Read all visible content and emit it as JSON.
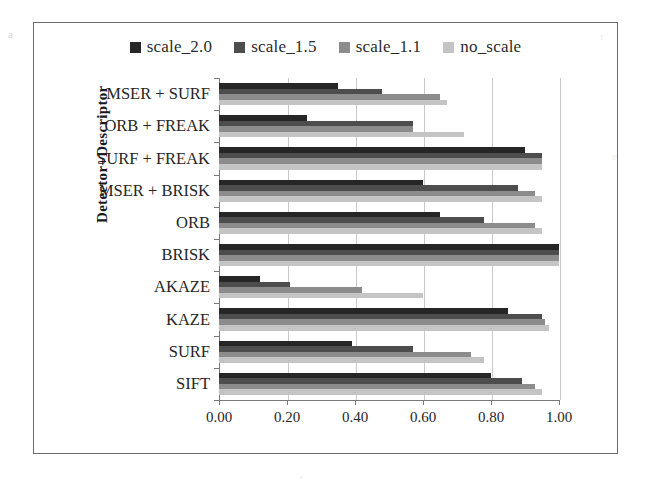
{
  "chart_data": {
    "type": "bar",
    "orientation": "horizontal",
    "title": "",
    "xlabel": "",
    "ylabel": "Detector+Descriptor",
    "xlim": [
      0.0,
      1.0
    ],
    "xticks": [
      "0.00",
      "0.20",
      "0.40",
      "0.60",
      "0.80",
      "1.00"
    ],
    "xtick_values": [
      0.0,
      0.2,
      0.4,
      0.6,
      0.8,
      1.0
    ],
    "grid": true,
    "legend_position": "top-center",
    "categories": [
      "MSER + SURF",
      "ORB + FREAK",
      "SURF + FREAK",
      "MSER + BRISK",
      "ORB",
      "BRISK",
      "AKAZE",
      "KAZE",
      "SURF",
      "SIFT"
    ],
    "series": [
      {
        "name": "scale_2.0",
        "color": "#262626",
        "values": [
          0.35,
          0.26,
          0.9,
          0.6,
          0.65,
          1.0,
          0.12,
          0.85,
          0.39,
          0.8
        ]
      },
      {
        "name": "scale_1.5",
        "color": "#4d4d4d",
        "values": [
          0.48,
          0.57,
          0.95,
          0.88,
          0.78,
          1.0,
          0.21,
          0.95,
          0.57,
          0.89
        ]
      },
      {
        "name": "scale_1.1",
        "color": "#8c8c8c",
        "values": [
          0.65,
          0.57,
          0.95,
          0.93,
          0.93,
          1.0,
          0.42,
          0.96,
          0.74,
          0.93
        ]
      },
      {
        "name": "no_scale",
        "color": "#c4c4c4",
        "values": [
          0.67,
          0.72,
          0.95,
          0.95,
          0.95,
          1.0,
          0.6,
          0.97,
          0.78,
          0.95
        ]
      }
    ]
  },
  "legend": {
    "items": [
      {
        "label": "scale_2.0",
        "color": "#262626"
      },
      {
        "label": "scale_1.5",
        "color": "#4d4d4d"
      },
      {
        "label": "scale_1.1",
        "color": "#8c8c8c"
      },
      {
        "label": "no_scale",
        "color": "#c4c4c4"
      }
    ]
  },
  "axes": {
    "y_title": "Detector+Descriptor"
  },
  "colors": {
    "frame": "#6b6b6b",
    "axis": "#7a7a7a",
    "gridline": "#c9c9c9",
    "text": "#262626",
    "background": "#ffffff"
  }
}
